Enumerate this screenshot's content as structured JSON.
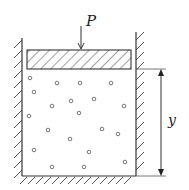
{
  "diagram": {
    "force_label": "P",
    "height_label": "y",
    "colors": {
      "stroke": "#333333",
      "hatch": "#444444",
      "particle": "#555555",
      "background": "#ffffff"
    },
    "particles": [
      [
        30,
        78
      ],
      [
        57,
        83
      ],
      [
        80,
        83
      ],
      [
        111,
        83
      ],
      [
        34,
        92
      ],
      [
        52,
        106
      ],
      [
        71,
        101
      ],
      [
        94,
        99
      ],
      [
        124,
        106
      ],
      [
        29,
        116
      ],
      [
        79,
        113
      ],
      [
        48,
        130
      ],
      [
        102,
        129
      ],
      [
        118,
        134
      ],
      [
        70,
        139
      ],
      [
        34,
        150
      ],
      [
        89,
        152
      ],
      [
        52,
        167
      ],
      [
        84,
        167
      ],
      [
        125,
        162
      ]
    ]
  }
}
